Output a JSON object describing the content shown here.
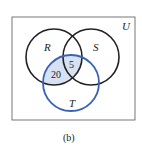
{
  "diagram": {
    "type": "venn",
    "universe_label": "U",
    "sets": [
      {
        "name": "R",
        "label": "R",
        "color": "#222222"
      },
      {
        "name": "S",
        "label": "S",
        "color": "#222222"
      },
      {
        "name": "T",
        "label": "T",
        "color": "#3a63b5"
      }
    ],
    "shaded_region": "R ∩ T",
    "shade_color": "#d6e2f2",
    "region_values": [
      {
        "region": "R ∩ S ∩ T",
        "value": "5"
      },
      {
        "region": "R ∩ T only",
        "value": "20"
      }
    ],
    "caption": "(b)"
  }
}
